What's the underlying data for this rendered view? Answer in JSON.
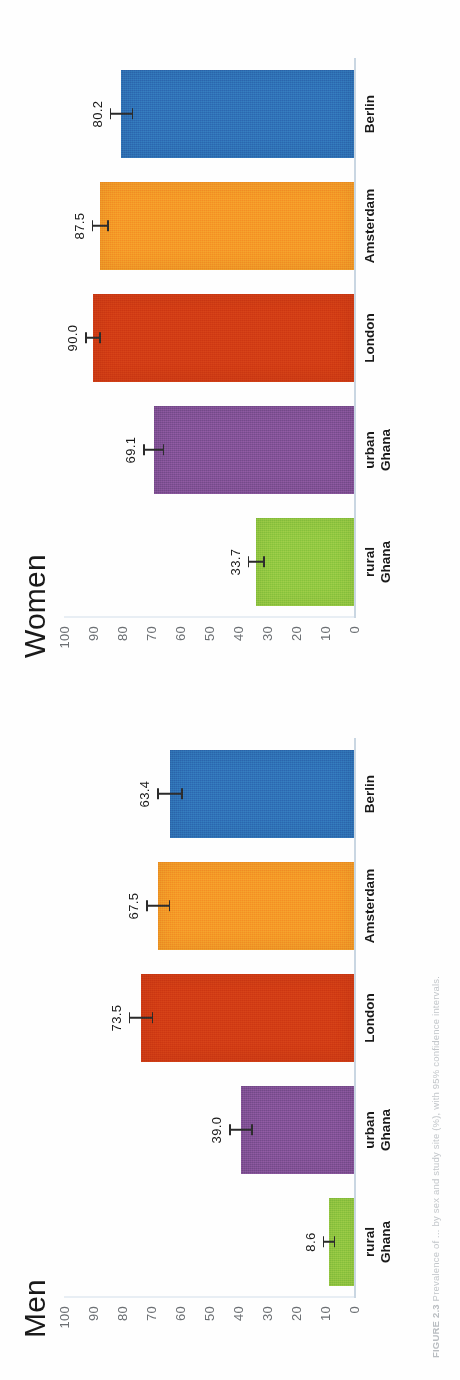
{
  "figure": {
    "caption_label": "FIGURE 2.3",
    "caption_text": "Prevalence of ... by sex and study site (%), with 95% confidence intervals."
  },
  "axis": {
    "ticks": [
      "100",
      "90",
      "80",
      "70",
      "60",
      "50",
      "40",
      "30",
      "20",
      "10",
      "0"
    ],
    "min": 0,
    "max": 100
  },
  "colors": {
    "green": "#8dc63f",
    "purple": "#7d4f92",
    "red": "#d03a14",
    "orange": "#f59426",
    "blue": "#2e6db4",
    "axis": "#c9d6e2",
    "text": "#1a1a1a",
    "tick_text": "#6b6f73"
  },
  "chart_data": {
    "type": "bar",
    "title": "",
    "xlabel": "",
    "ylabel": "",
    "ylim": [
      0,
      100
    ],
    "grid": false,
    "legend": "none",
    "yticks": [
      0,
      10,
      20,
      30,
      40,
      50,
      60,
      70,
      80,
      90,
      100
    ],
    "categories": [
      "rural Ghana",
      "urban Ghana",
      "London",
      "Amsterdam",
      "Berlin"
    ],
    "panels": [
      {
        "name": "Men",
        "title": "Men",
        "values": [
          8.6,
          39.0,
          73.5,
          67.5,
          63.4
        ],
        "value_labels": [
          "8.6",
          "39.0",
          "73.5",
          "67.5",
          "63.4"
        ],
        "errors": [
          2.2,
          4.0,
          4.2,
          4.2,
          4.4
        ]
      },
      {
        "name": "Women",
        "title": "Women",
        "values": [
          33.7,
          69.1,
          90.0,
          87.5,
          80.2
        ],
        "value_labels": [
          "33.7",
          "69.1",
          "90.0",
          "87.5",
          "80.2"
        ],
        "errors": [
          3.0,
          3.6,
          2.6,
          3.0,
          4.0
        ]
      }
    ],
    "series": [
      {
        "name": "Men",
        "values": [
          8.6,
          39.0,
          73.5,
          67.5,
          63.4
        ]
      },
      {
        "name": "Women",
        "values": [
          33.7,
          69.1,
          90.0,
          87.5,
          80.2
        ]
      }
    ],
    "bar_colors": [
      "#8dc63f",
      "#7d4f92",
      "#d03a14",
      "#f59426",
      "#2e6db4"
    ]
  }
}
